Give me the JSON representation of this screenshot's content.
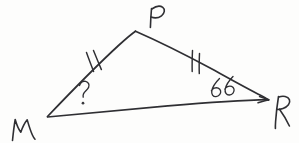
{
  "figure": {
    "background_color": "#fdfdfc",
    "ink_color": "#2f2f33",
    "shape": "triangle",
    "vertices": [
      {
        "id": "M",
        "label": "M",
        "x": 47,
        "y": 117,
        "label_x": 18,
        "label_y": 122
      },
      {
        "id": "P",
        "label": "P",
        "x": 135,
        "y": 31,
        "label_x": 152,
        "label_y": 16
      },
      {
        "id": "R",
        "label": "R",
        "x": 268,
        "y": 100,
        "label_x": 283,
        "label_y": 113
      }
    ],
    "sides": [
      {
        "id": "MP",
        "from": "M",
        "to": "P",
        "tick_marks": 2,
        "congruent_group": 1
      },
      {
        "id": "PR",
        "from": "P",
        "to": "R",
        "tick_marks": 2,
        "congruent_group": 1
      },
      {
        "id": "MR",
        "from": "M",
        "to": "R",
        "tick_marks": 0,
        "congruent_group": 0
      }
    ],
    "angles": [
      {
        "at_vertex": "M",
        "label": "?",
        "unit": "°",
        "known": false,
        "label_x": 82,
        "label_y": 96
      },
      {
        "at_vertex": "R",
        "label": "66",
        "unit": "",
        "known": true,
        "label_x": 222,
        "label_y": 90
      }
    ]
  },
  "labels": {
    "vertex_m": "M",
    "vertex_p": "P",
    "vertex_r": "R",
    "angle_unknown": "?",
    "angle_known": "66",
    "degree_mark": "°"
  }
}
